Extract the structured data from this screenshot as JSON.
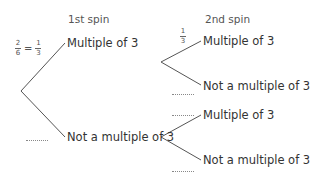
{
  "headers": {
    "first": "1st spin",
    "second": "2nd spin"
  },
  "first_spin": {
    "top": {
      "label": "Multiple of 3",
      "probability": {
        "given_num": "2",
        "given_den": "6",
        "eq": "=",
        "num": "1",
        "den": "3"
      }
    },
    "bottom": {
      "label": "Not a multiple of 3",
      "probability": ""
    }
  },
  "second_spin": {
    "upper": {
      "top": {
        "label": "Multiple of 3",
        "probability": {
          "num": "1",
          "den": "3"
        }
      },
      "bottom": {
        "label": "Not a multiple of 3",
        "probability": ""
      }
    },
    "lower": {
      "top": {
        "label": "Multiple of 3",
        "probability": ""
      },
      "bottom": {
        "label": "Not a multiple of 3",
        "probability": ""
      }
    }
  },
  "colors": {
    "line": "#555555",
    "text": "#333333"
  }
}
